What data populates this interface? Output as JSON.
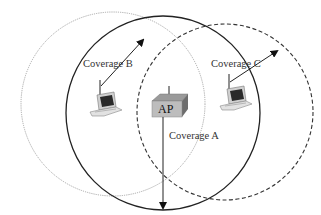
{
  "diagram": {
    "type": "wireless-coverage",
    "nodes": [
      {
        "id": "ap",
        "label": "AP",
        "icon": "access-point-icon"
      },
      {
        "id": "laptop-b",
        "label": "",
        "icon": "laptop-icon"
      },
      {
        "id": "laptop-c",
        "label": "",
        "icon": "laptop-icon"
      }
    ],
    "coverages": [
      {
        "id": "A",
        "label": "Coverage A",
        "style": "solid",
        "color": "#222222",
        "cx": 163,
        "cy": 113,
        "r": 97
      },
      {
        "id": "B",
        "label": "Coverage B",
        "style": "dotted",
        "color": "#9a9a9a",
        "cx": 113,
        "cy": 104,
        "r": 92
      },
      {
        "id": "C",
        "label": "Coverage C",
        "style": "dashed",
        "color": "#333333",
        "cx": 225,
        "cy": 112,
        "r": 88
      }
    ]
  },
  "labels": {
    "coverage_a": "Coverage A",
    "coverage_b": "Coverage B",
    "coverage_c": "Coverage C",
    "ap": "AP"
  }
}
